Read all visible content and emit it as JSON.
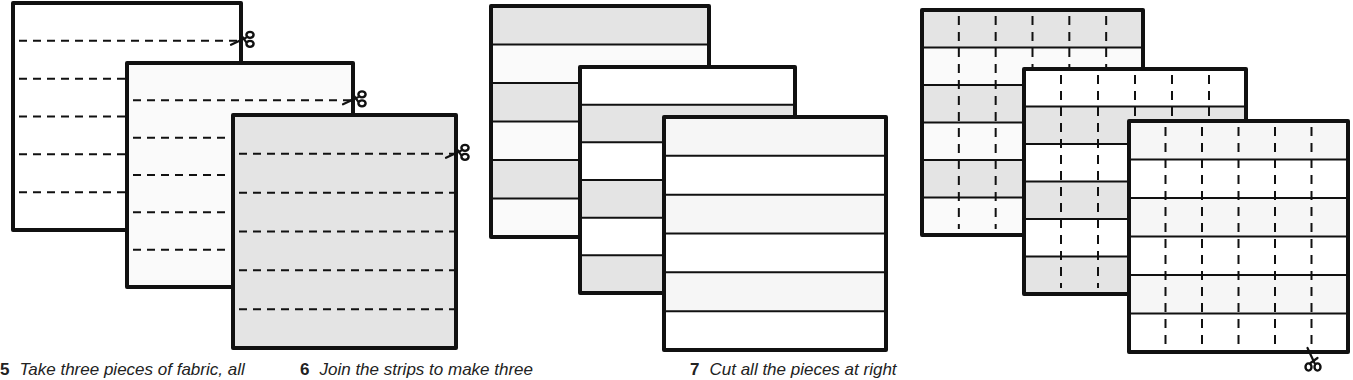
{
  "diagram": {
    "colors": {
      "outline": "#111111",
      "fabric_white": "#ffffff",
      "fabric_offwhite": "#fafafa",
      "fabric_light": "#f6f6f6",
      "fabric_gray": "#e4e4e4"
    },
    "steps": [
      {
        "number": "5",
        "caption": "Take three pieces of fabric, all",
        "caption_x": 0,
        "description": "Three overlapping fabric squares (white, off-white, gray) each marked with horizontal dashed cutting lines; scissors at the top-right cut line of each",
        "panels": [
          {
            "x": 13,
            "y": 3,
            "w": 228,
            "h": 227,
            "fill": "#ffffff",
            "lines": "h-dashed",
            "line_count": 5,
            "scissors": "right"
          },
          {
            "x": 127,
            "y": 63,
            "w": 226,
            "h": 224,
            "fill": "#fafafa",
            "lines": "h-dashed",
            "line_count": 5,
            "scissors": "right"
          },
          {
            "x": 233,
            "y": 115,
            "w": 223,
            "h": 233,
            "fill": "#e4e4e4",
            "lines": "h-dashed",
            "line_count": 5,
            "scissors": "right"
          }
        ]
      },
      {
        "number": "6",
        "caption": "Join the strips to make three",
        "caption_x": 300,
        "description": "Three overlapping squares made of six joined strips in alternating shades",
        "panels": [
          {
            "x": 491,
            "y": 6,
            "w": 218,
            "h": 231,
            "strips": [
              "#e4e4e4",
              "#fafafa",
              "#e4e4e4",
              "#fafafa",
              "#e4e4e4",
              "#fafafa"
            ],
            "lines": "h-solid"
          },
          {
            "x": 580,
            "y": 67,
            "w": 215,
            "h": 226,
            "strips": [
              "#ffffff",
              "#e4e4e4",
              "#ffffff",
              "#e4e4e4",
              "#ffffff",
              "#e4e4e4"
            ],
            "lines": "h-solid"
          },
          {
            "x": 664,
            "y": 117,
            "w": 222,
            "h": 233,
            "strips": [
              "#f6f6f6",
              "#ffffff",
              "#f6f6f6",
              "#ffffff",
              "#f6f6f6",
              "#ffffff"
            ],
            "lines": "h-solid"
          }
        ]
      },
      {
        "number": "7",
        "caption": "Cut all the pieces at right",
        "caption_x": 690,
        "description": "The three striped squares with vertical dashed cutting lines at right angles to the seams; scissors at bottom of last line",
        "panels": [
          {
            "x": 922,
            "y": 10,
            "w": 221,
            "h": 225,
            "strips": [
              "#e4e4e4",
              "#fafafa",
              "#e4e4e4",
              "#fafafa",
              "#e4e4e4",
              "#fafafa"
            ],
            "lines": "h-solid+v-dashed",
            "v_count": 5
          },
          {
            "x": 1024,
            "y": 69,
            "w": 222,
            "h": 225,
            "strips": [
              "#ffffff",
              "#e4e4e4",
              "#ffffff",
              "#e4e4e4",
              "#ffffff",
              "#e4e4e4"
            ],
            "lines": "h-solid+v-dashed",
            "v_count": 5
          },
          {
            "x": 1129,
            "y": 121,
            "w": 219,
            "h": 231,
            "strips": [
              "#f6f6f6",
              "#ffffff",
              "#f6f6f6",
              "#ffffff",
              "#f6f6f6",
              "#ffffff"
            ],
            "lines": "h-solid+v-dashed",
            "v_count": 5,
            "scissors": "bottom"
          }
        ]
      }
    ]
  }
}
